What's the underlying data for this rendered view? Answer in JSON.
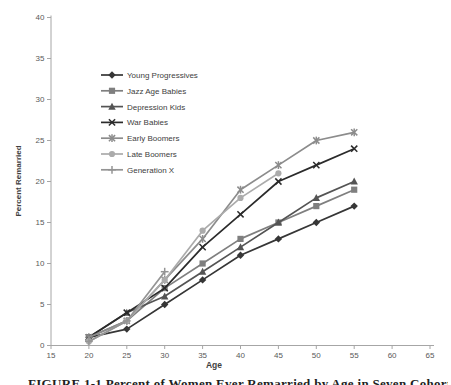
{
  "figure": {
    "caption": "FIGURE 1-1 Percent of Women Ever Remarried by Age in Seven Cohorts"
  },
  "chart_data": {
    "type": "line",
    "title": "",
    "xlabel": "Age",
    "ylabel": "Percent Remarried",
    "xlim": [
      15,
      65
    ],
    "ylim": [
      0,
      40
    ],
    "x_ticks": [
      15,
      20,
      25,
      30,
      35,
      40,
      45,
      50,
      55,
      60,
      65
    ],
    "y_ticks": [
      0,
      5,
      10,
      15,
      20,
      25,
      30,
      35,
      40
    ],
    "grid": false,
    "legend_position": "upper-left-inside",
    "axis_color": "#a6a6a6",
    "tick_label_color": "#595959",
    "x": [
      20,
      25,
      30,
      35,
      40,
      45,
      50,
      55
    ],
    "series": [
      {
        "name": "Young Progressives",
        "marker": "diamond",
        "color": "#363636",
        "values": [
          1,
          2,
          5,
          8,
          11,
          13,
          15,
          17
        ]
      },
      {
        "name": "Jazz Age Babies",
        "marker": "square",
        "color": "#7f7f7f",
        "values": [
          1,
          3,
          7,
          10,
          13,
          15,
          17,
          19
        ]
      },
      {
        "name": "Depression Kids",
        "marker": "triangle",
        "color": "#545454",
        "values": [
          1,
          4,
          6,
          9,
          12,
          15,
          18,
          20
        ]
      },
      {
        "name": "War Babies",
        "marker": "x",
        "color": "#2b2b2b",
        "values": [
          1,
          4,
          7,
          12,
          16,
          20,
          22,
          24
        ]
      },
      {
        "name": "Early Boomers",
        "marker": "asterisk",
        "color": "#8c8c8c",
        "values": [
          1,
          3,
          8,
          13,
          19,
          22,
          25,
          26
        ]
      },
      {
        "name": "Late Boomers",
        "marker": "circle",
        "color": "#ababab",
        "values": [
          0.5,
          3,
          8,
          14,
          18,
          21,
          null,
          null
        ]
      },
      {
        "name": "Generation X",
        "marker": "plus",
        "color": "#949494",
        "values": [
          0.5,
          3,
          9,
          null,
          null,
          null,
          null,
          null
        ]
      }
    ]
  }
}
